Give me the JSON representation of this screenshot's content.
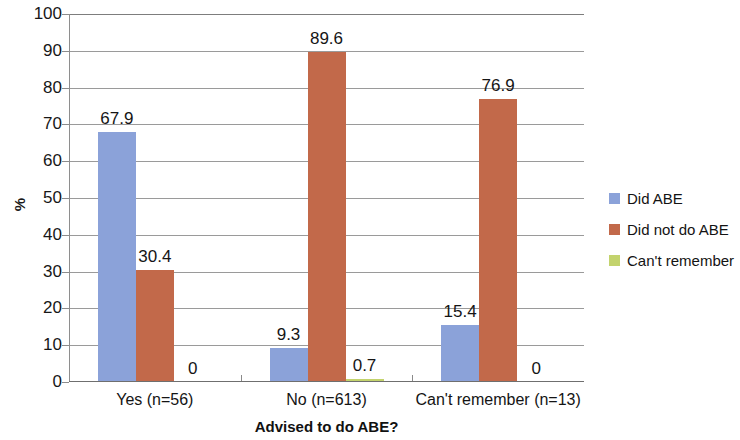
{
  "chart_data": {
    "type": "bar",
    "title": "",
    "xlabel": "Advised to do ABE?",
    "ylabel": "%",
    "ylim": [
      0,
      100
    ],
    "ytick_step": 10,
    "yticks": [
      "100",
      "90",
      "80",
      "70",
      "60",
      "50",
      "40",
      "30",
      "20",
      "10",
      "0"
    ],
    "grid": true,
    "legend_position": "right",
    "categories": [
      "Yes (n=56)",
      "No (n=613)",
      "Can't remember (n=13)"
    ],
    "series": [
      {
        "name": "Did ABE",
        "color": "#8ba2d9",
        "values": [
          67.9,
          9.3,
          15.4
        ],
        "labels": [
          "67.9",
          "9.3",
          "15.4"
        ]
      },
      {
        "name": "Did not do ABE",
        "color": "#c2694a",
        "values": [
          30.4,
          89.6,
          76.9
        ],
        "labels": [
          "30.4",
          "89.6",
          "76.9"
        ]
      },
      {
        "name": "Can't remember",
        "color": "#c3d36d",
        "values": [
          0,
          0.7,
          0
        ],
        "labels": [
          "0",
          "0.7",
          "0"
        ]
      }
    ]
  },
  "legend": {
    "items": [
      {
        "label": "Did ABE",
        "color": "#8ba2d9"
      },
      {
        "label": "Did not do ABE",
        "color": "#c2694a"
      },
      {
        "label": "Can't remember",
        "color": "#c3d36d"
      }
    ]
  },
  "axes": {
    "y_title": "%",
    "x_title": "Advised to do ABE?"
  }
}
